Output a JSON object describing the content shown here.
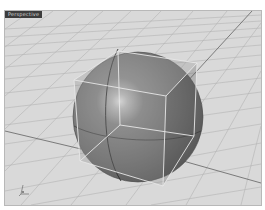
{
  "viewport": {
    "tab_label": "Perspective",
    "background_color": "#d9d9d9",
    "grid_color": "#b5b5b5",
    "axis_line_color": "#7a7a7a"
  },
  "scene": {
    "objects": [
      {
        "type": "sphere",
        "name": "sphere",
        "color": "#6e6e6e",
        "highlight": "#f2f2f2"
      },
      {
        "type": "box",
        "name": "cube",
        "edge_color": "#e6e6e6",
        "face_color": "#8a8a8a"
      }
    ]
  },
  "axis_gizmo": {
    "icon": "axis-gizmo-icon"
  }
}
